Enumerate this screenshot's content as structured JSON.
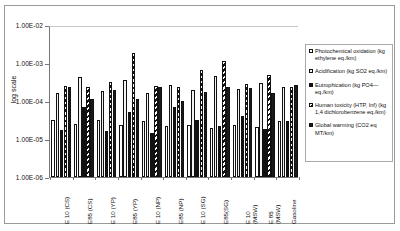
{
  "chart_data": {
    "type": "bar",
    "title": "",
    "xlabel": "",
    "ylabel": "log scale",
    "yscale": "log",
    "ylim": [
      1e-06,
      0.01
    ],
    "yticks": [
      "1.00E-02",
      "1.00E-03",
      "1.00E-04",
      "1.00E-05",
      "1.00E-06"
    ],
    "grid": false,
    "legend_position": "right",
    "categories": [
      "E 10 (CS)",
      "E85 (CS)",
      "E 10 (YP)",
      "E85 (YP)",
      "E 10 (NP)",
      "E85 (NP)",
      "E 10 (SG)",
      "E85(SG)",
      "E 10\n(MSW)",
      "E 85\n(MSW)",
      "Gasoline"
    ],
    "series": [
      {
        "name": "Photochemical oxidation (kg ethylene eq./km)",
        "pattern": "white",
        "values": [
          3.1e-05,
          2.5e-05,
          3.2e-05,
          2.3e-05,
          2.9e-05,
          2.2e-05,
          2.4e-05,
          2e-05,
          2.3e-05,
          2.1e-05,
          3e-05
        ]
      },
      {
        "name": "Acidification (kg SO2 eq./km)",
        "pattern": "light-dotted",
        "values": [
          0.00016,
          0.00042,
          0.00018,
          0.00035,
          0.00016,
          0.00026,
          0.00019,
          0.00046,
          0.00021,
          0.0003,
          0.00023
        ]
      },
      {
        "name": "Eutrophication (kg PO4— eq./km)",
        "pattern": "black",
        "values": [
          1.7e-05,
          7.1e-05,
          1.6e-05,
          5.1e-05,
          1.4e-05,
          7e-05,
          3.2e-05,
          2.2e-05,
          4e-05,
          1.8e-05,
          2.9e-05
        ]
      },
      {
        "name": "Human toxicity (HTP, Inf) (kg 1,4 dichlorobenzene eq./km)",
        "pattern": "diagonal-hatch",
        "values": [
          0.00025,
          0.00023,
          0.00031,
          0.00185,
          0.00025,
          0.00024,
          0.00066,
          0.0011,
          0.00028,
          0.00049,
          0.00023
        ]
      },
      {
        "name": "Global warming (CO2 eq MT/km)",
        "pattern": "black-solid",
        "values": [
          0.00024,
          0.00011,
          0.0002,
          0.00011,
          0.00023,
          0.0001,
          0.00017,
          0.00024,
          0.00022,
          0.00016,
          0.00026
        ]
      }
    ],
    "legend": [
      {
        "label": "Photochemical oxidation (kg ethylene eq./km)",
        "swatch": "white"
      },
      {
        "label": "Acidification (kg SO2 eq./km)",
        "swatch": "light-dotted"
      },
      {
        "label": "Eutrophication (kg PO4— eq./km)",
        "swatch": "black"
      },
      {
        "label": "Human toxicity (HTP, Inf) (kg 1,4 dichlorobenzene eq./km)",
        "swatch": "diagonal-hatch"
      },
      {
        "label": "Global warming (CO2 eq MT/km)",
        "swatch": "black-solid"
      }
    ]
  }
}
